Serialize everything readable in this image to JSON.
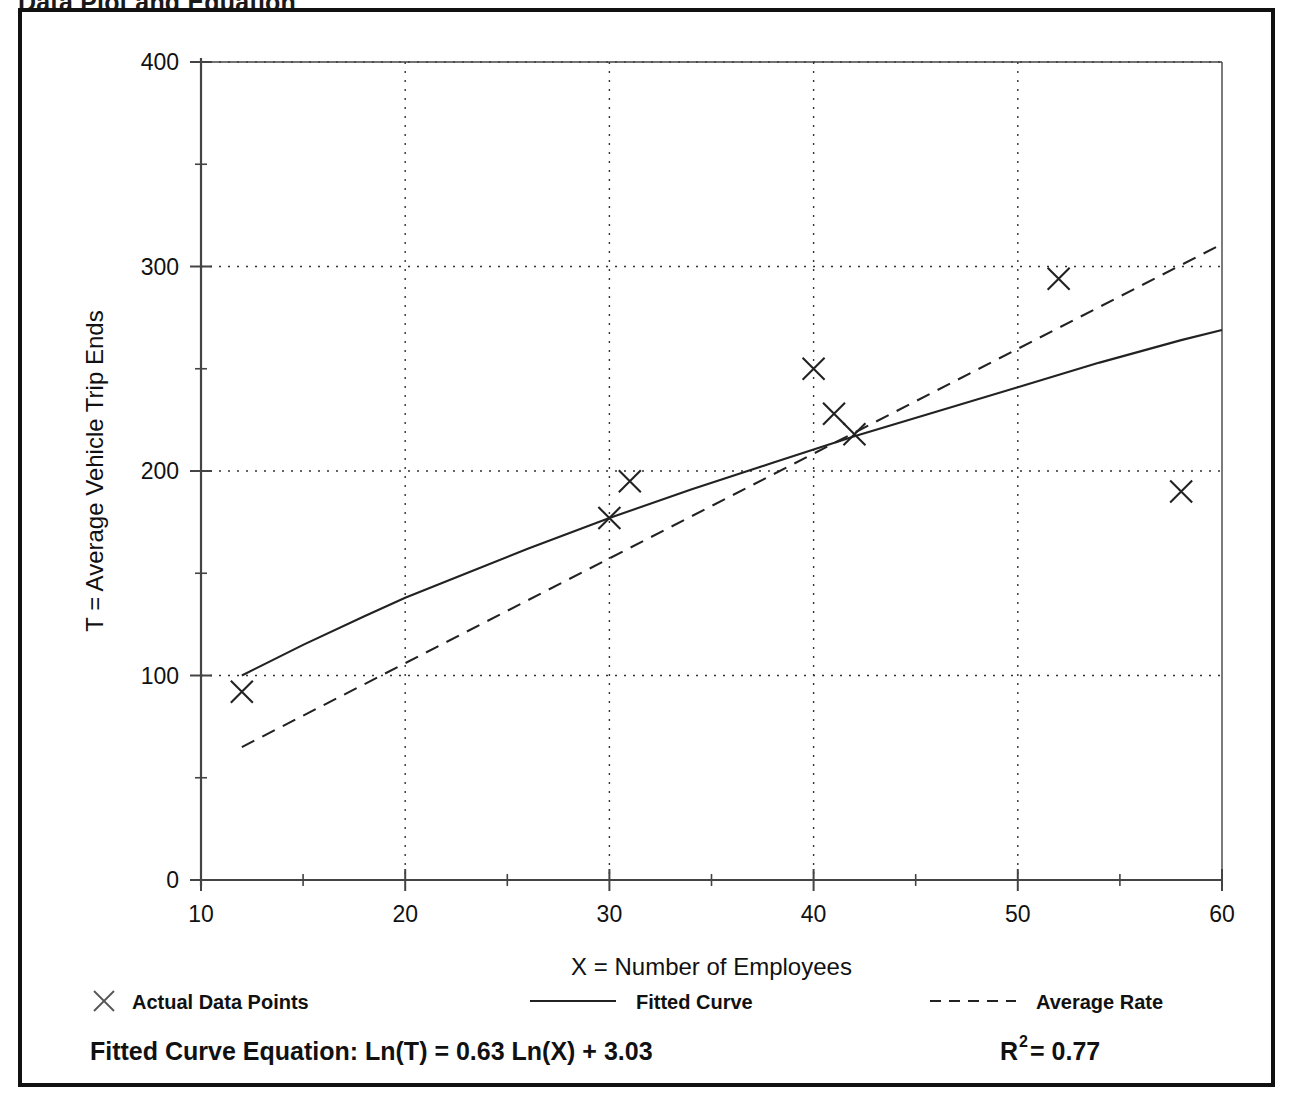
{
  "figure": {
    "clipped_title": "Data Plot and Equation",
    "border_color": "#111111"
  },
  "chart_data": {
    "type": "scatter",
    "title": "",
    "xlabel": "X = Number of Employees",
    "ylabel": "T = Average Vehicle Trip Ends",
    "xlim": [
      10,
      60
    ],
    "ylim": [
      0,
      400
    ],
    "xticks": [
      10,
      20,
      30,
      40,
      50,
      60
    ],
    "xtick_labels": [
      "10",
      "20",
      "30",
      "40",
      "50",
      "60"
    ],
    "xminor_ticks": [
      15,
      25,
      35,
      45,
      55
    ],
    "yticks": [
      0,
      100,
      200,
      300,
      400
    ],
    "ytick_labels": [
      "0",
      "100",
      "200",
      "300",
      "400"
    ],
    "yminor_ticks": [
      50,
      150,
      250,
      350
    ],
    "grid": "dotted-major-both",
    "legend_position": "below-axes",
    "series": [
      {
        "name": "Actual Data Points",
        "type": "scatter",
        "marker": "x",
        "color": "#222222",
        "points": [
          {
            "x": 12,
            "y": 92
          },
          {
            "x": 30,
            "y": 177
          },
          {
            "x": 31,
            "y": 195
          },
          {
            "x": 40,
            "y": 250
          },
          {
            "x": 41,
            "y": 228
          },
          {
            "x": 42,
            "y": 218
          },
          {
            "x": 52,
            "y": 294
          },
          {
            "x": 58,
            "y": 190
          }
        ]
      },
      {
        "name": "Fitted Curve",
        "type": "line",
        "style": "solid",
        "color": "#222222",
        "equation": "Ln(T) = 0.63 Ln(X) + 3.03",
        "intercept": 3.03,
        "slope": 0.63,
        "points": [
          {
            "x": 12,
            "y": 100
          },
          {
            "x": 15,
            "y": 115
          },
          {
            "x": 18,
            "y": 129
          },
          {
            "x": 20,
            "y": 138
          },
          {
            "x": 23,
            "y": 150
          },
          {
            "x": 26,
            "y": 162
          },
          {
            "x": 30,
            "y": 177
          },
          {
            "x": 34,
            "y": 191
          },
          {
            "x": 38,
            "y": 204
          },
          {
            "x": 42,
            "y": 217
          },
          {
            "x": 46,
            "y": 229
          },
          {
            "x": 50,
            "y": 241
          },
          {
            "x": 54,
            "y": 253
          },
          {
            "x": 58,
            "y": 264
          },
          {
            "x": 60,
            "y": 269
          }
        ]
      },
      {
        "name": "Average Rate",
        "type": "line",
        "style": "dashed",
        "color": "#222222",
        "points": [
          {
            "x": 12,
            "y": 65
          },
          {
            "x": 60,
            "y": 311
          }
        ]
      }
    ],
    "legend": [
      {
        "label": "Actual Data Points",
        "marker": "x"
      },
      {
        "label": "Fitted Curve",
        "marker": "solid-line"
      },
      {
        "label": "Average Rate",
        "marker": "dashed-line"
      }
    ],
    "annotations": {
      "equation_label": "Fitted Curve Equation:",
      "equation_body": "Ln(T) = 0.63 Ln(X) + 3.03",
      "r_squared_base": "R",
      "r_squared_exp": "2",
      "r_squared_value": " = 0.77"
    }
  }
}
